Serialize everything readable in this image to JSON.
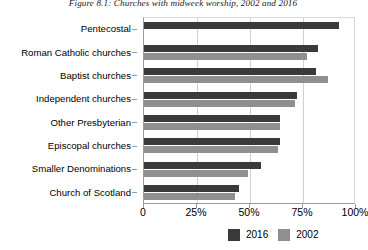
{
  "chart_data": {
    "type": "bar",
    "orientation": "horizontal",
    "title": "Figure 8.1: Churches with midweek worship, 2002 and 2016",
    "xlabel": "",
    "ylabel": "",
    "categories": [
      "Pentecostal",
      "Roman Catholic churches",
      "Baptist churches",
      "Independent churches",
      "Other Presbyterian",
      "Episcopal churches",
      "Smaller Denominations",
      "Church of Scotland"
    ],
    "series": [
      {
        "name": "2016",
        "color": "#3a3a3a",
        "values": [
          92,
          82,
          81,
          72,
          64,
          64,
          55,
          45
        ]
      },
      {
        "name": "2002",
        "color": "#8f8f8f",
        "values": [
          null,
          77,
          87,
          71,
          64,
          63,
          49,
          43
        ]
      }
    ],
    "xlim": [
      0,
      100
    ],
    "xticks": [
      0,
      25,
      50,
      75,
      100
    ],
    "xtick_labels": [
      "0",
      "25%",
      "50%",
      "75%",
      "100%"
    ],
    "grid": true,
    "legend_position": "bottom-right",
    "legend": [
      {
        "label": "2016",
        "color": "#3a3a3a"
      },
      {
        "label": "2002",
        "color": "#8f8f8f"
      }
    ]
  }
}
